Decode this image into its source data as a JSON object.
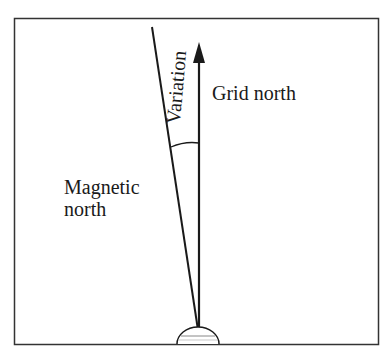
{
  "diagram": {
    "type": "compass-variation",
    "frame": {
      "stroke": "#333333",
      "fill": "#ffffff"
    },
    "labels": {
      "grid_north": "Grid north",
      "magnetic_north_line1": "Magnetic",
      "magnetic_north_line2": "north",
      "variation": "Variation"
    },
    "lines": {
      "grid_north": {
        "from": [
          199,
          330
        ],
        "to": [
          199,
          44
        ],
        "arrow": true
      },
      "magnetic_north": {
        "from": [
          198,
          330
        ],
        "to": [
          152,
          27
        ],
        "arrow": false
      }
    },
    "colors": {
      "ink": "#1a1a1a",
      "background": "#ffffff"
    }
  }
}
